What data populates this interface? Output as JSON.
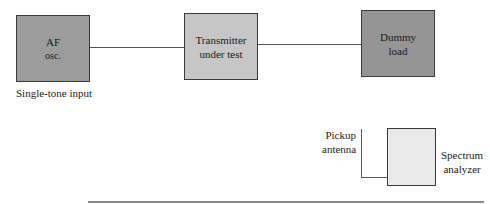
{
  "diagram": {
    "blocks": [
      {
        "id": "af_osc",
        "lines": [
          "AF",
          "osc."
        ],
        "fill": "#9c9c9c"
      },
      {
        "id": "transmitter",
        "lines": [
          "Transmitter",
          "under test"
        ],
        "fill": "#c6c6c6"
      },
      {
        "id": "dummy_load",
        "lines": [
          "Dummy",
          "load"
        ],
        "fill": "#959595"
      },
      {
        "id": "spectrum_analyzer",
        "fill": "#e9e9e9"
      }
    ],
    "labels": {
      "af_caption": "Single-tone input",
      "antenna": [
        "Pickup",
        "antenna"
      ],
      "analyzer": [
        "Spectrum",
        "analyzer"
      ]
    },
    "connections": [
      {
        "from": "af_osc",
        "to": "transmitter"
      },
      {
        "from": "transmitter",
        "to": "dummy_load"
      },
      {
        "from": "pickup_antenna",
        "to": "spectrum_analyzer"
      }
    ]
  }
}
